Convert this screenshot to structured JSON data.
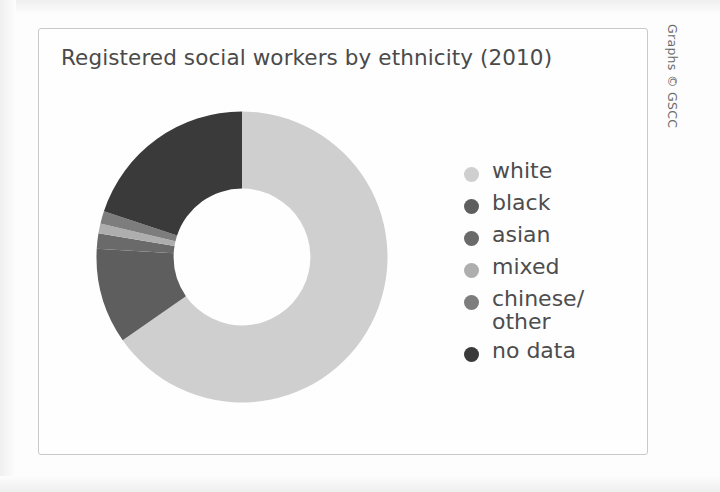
{
  "chart_title": "Registered social workers by ethnicity (2010)",
  "credit": "Graphs © GSCC",
  "legend": {
    "items": [
      {
        "label": "white",
        "color": "#cfcfcf",
        "swatch_name": "legend-swatch-white"
      },
      {
        "label": "black",
        "color": "#5e5e5e",
        "swatch_name": "legend-swatch-black"
      },
      {
        "label": "asian",
        "color": "#6a6a6a",
        "swatch_name": "legend-swatch-asian"
      },
      {
        "label": "mixed",
        "color": "#aeaeae",
        "swatch_name": "legend-swatch-mixed"
      },
      {
        "label": "chinese/\nother",
        "color": "#7d7d7d",
        "swatch_name": "legend-swatch-chinese-other"
      },
      {
        "label": "no data",
        "color": "#3a3a3a",
        "swatch_name": "legend-swatch-no-data"
      }
    ]
  },
  "chart_data": {
    "type": "pie",
    "title": "Registered social workers by ethnicity (2010)",
    "subtitle": "",
    "xlabel": "",
    "ylabel": "",
    "donut": true,
    "inner_radius_ratio": 0.47,
    "start_angle_deg": 0,
    "direction": "clockwise",
    "legend_position": "right",
    "grid": false,
    "units": "percent",
    "categories": [
      "white",
      "black",
      "asian",
      "mixed",
      "chinese/other",
      "no data"
    ],
    "values": [
      65.3,
      10.6,
      1.7,
      1.1,
      1.4,
      19.9
    ],
    "colors": [
      "#cfcfcf",
      "#5e5e5e",
      "#6a6a6a",
      "#aeaeae",
      "#7d7d7d",
      "#3a3a3a"
    ],
    "series": [
      {
        "name": "Registered social workers by ethnicity (2010)",
        "values": [
          65.3,
          10.6,
          1.7,
          1.1,
          1.4,
          19.9
        ]
      }
    ],
    "annotations": []
  }
}
